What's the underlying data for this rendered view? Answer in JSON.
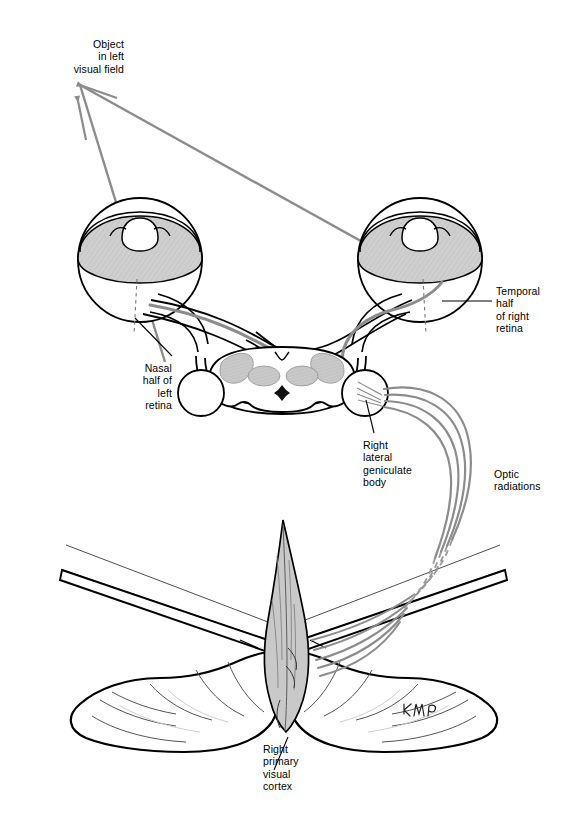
{
  "figure": {
    "type": "anatomical-diagram",
    "width": 566,
    "height": 830,
    "background_color": "#ffffff",
    "ink_color": "#000000",
    "ray_color": "#8c8c8c",
    "tract_color": "#8c8c8c",
    "shade_color": "#c9c9c9",
    "signature": "KWP"
  },
  "labels": {
    "object": "Object\nin left\nvisual field",
    "nasal": "Nasal\nhalf of\nleft\nretina",
    "temporal": "Temporal\nhalf\nof right\nretina",
    "lgb": "Right\nlateral\ngeniculate\nbody",
    "optic_radiations": "Optic\nradiations",
    "cortex": "Right\nprimary\nvisual\ncortex"
  },
  "structures": [
    {
      "name": "left-eye",
      "label": "Left eyeball with shaded retina"
    },
    {
      "name": "right-eye",
      "label": "Right eyeball with shaded retina"
    },
    {
      "name": "optic-chiasm",
      "label": "Optic chiasm"
    },
    {
      "name": "midbrain",
      "label": "Midbrain cross-section"
    },
    {
      "name": "left-lateral-geniculate",
      "label": "Left lateral geniculate body"
    },
    {
      "name": "right-lateral-geniculate",
      "label": "Right lateral geniculate body"
    },
    {
      "name": "optic-radiations",
      "label": "Optic radiations"
    },
    {
      "name": "occipital-lobes",
      "label": "Occipital lobes seen from behind"
    },
    {
      "name": "visual-cortex",
      "label": "Right primary visual cortex (shaded)"
    },
    {
      "name": "light-rays",
      "label": "Light rays from object in left visual field"
    }
  ]
}
